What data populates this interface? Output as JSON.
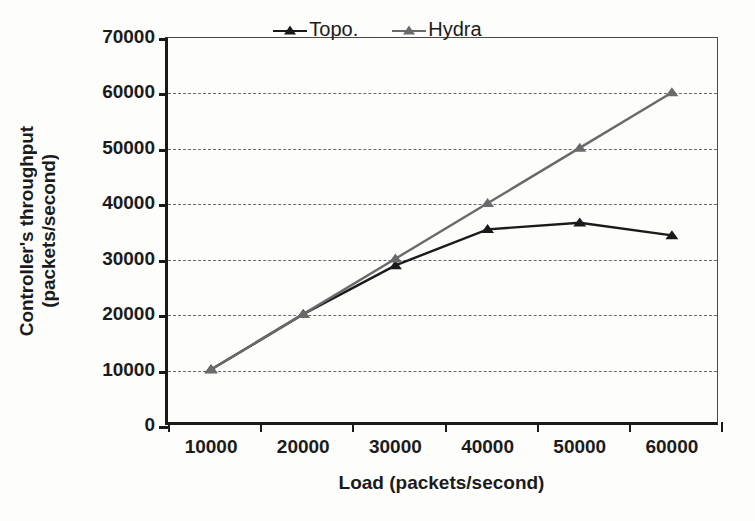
{
  "chart_data": {
    "type": "line",
    "title": "",
    "xlabel": "Load (packets/second)",
    "ylabel": "Controller's throughput (packets/second)",
    "ylabel_lines": [
      "Controller's throughput",
      "(packets/second)"
    ],
    "categories": [
      10000,
      20000,
      30000,
      40000,
      50000,
      60000
    ],
    "x_tick_labels": [
      "10000",
      "20000",
      "30000",
      "40000",
      "50000",
      "60000"
    ],
    "y_tick_labels": [
      "0",
      "10000",
      "20000",
      "30000",
      "40000",
      "50000",
      "60000",
      "70000"
    ],
    "y_ticks": [
      0,
      10000,
      20000,
      30000,
      40000,
      50000,
      60000,
      70000
    ],
    "ylim": [
      0,
      70000
    ],
    "grid": "horizontal-dash-dot",
    "legend_position": "top-center-inside",
    "series": [
      {
        "name": "Topo.",
        "color": "#1a1a1a",
        "marker": "triangle",
        "values": [
          10000,
          20000,
          28800,
          35300,
          36500,
          34200
        ]
      },
      {
        "name": "Hydra",
        "color": "#6a6a6a",
        "marker": "triangle",
        "values": [
          10000,
          20000,
          30000,
          40000,
          50000,
          60000
        ]
      }
    ]
  },
  "legend": {
    "items": [
      {
        "label": "Topo.",
        "color": "#1a1a1a"
      },
      {
        "label": "Hydra",
        "color": "#6a6a6a"
      }
    ]
  },
  "axes": {
    "x_title": "Load (packets/second)",
    "y_title_line1": "Controller's throughput",
    "y_title_line2": "(packets/second)"
  }
}
